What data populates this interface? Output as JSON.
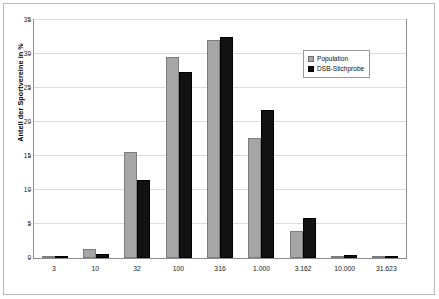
{
  "chart_data": {
    "type": "bar",
    "title": "",
    "xlabel": "",
    "ylabel": "Anteil der Sportvereine in %",
    "ylim": [
      0,
      35
    ],
    "yticks": [
      0,
      5,
      10,
      15,
      20,
      25,
      30,
      35
    ],
    "grid": true,
    "legend_position": "top-right",
    "categories": [
      "3",
      "10",
      "32",
      "100",
      "316",
      "1.000",
      "3.162",
      "10.000",
      "31.623"
    ],
    "series": [
      {
        "name": "Population",
        "color": "#a6a6a6",
        "values": [
          0.1,
          1.3,
          15.6,
          29.6,
          32.1,
          17.6,
          4.0,
          0.3,
          0.0
        ]
      },
      {
        "name": "DSB-Stichprobe",
        "color": "#121212",
        "values": [
          0.1,
          0.6,
          11.5,
          27.3,
          32.5,
          21.8,
          5.9,
          0.4,
          0.0
        ]
      }
    ]
  },
  "legend": {
    "items": [
      {
        "label": "Population"
      },
      {
        "label": "DSB-Stichprobe"
      }
    ]
  }
}
